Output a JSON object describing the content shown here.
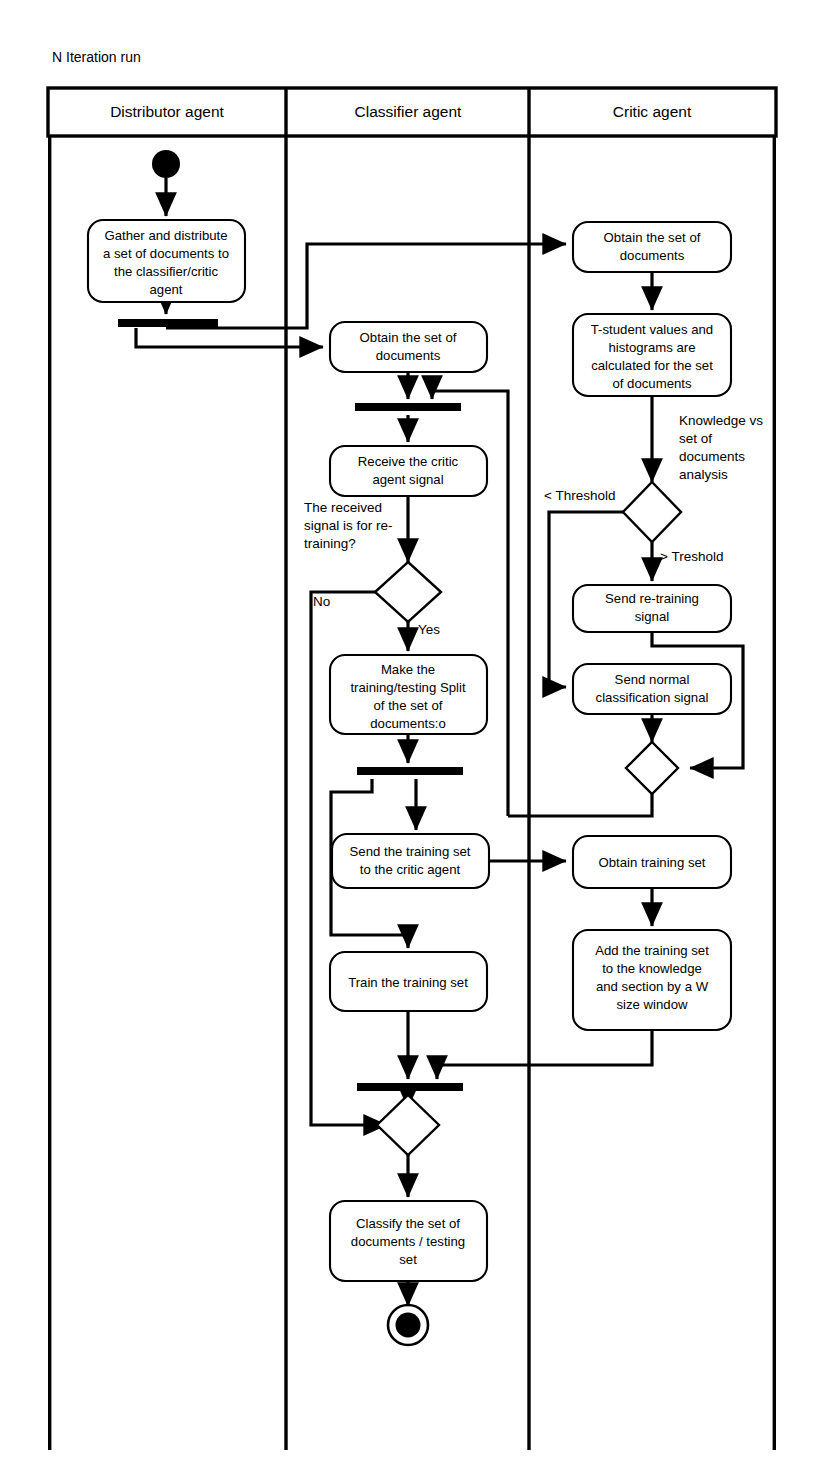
{
  "diagram": {
    "caption": "N Iteration run",
    "type": "uml-activity-diagram",
    "lanes": [
      {
        "id": "distributor",
        "label": "Distributor agent"
      },
      {
        "id": "classifier",
        "label": "Classifier agent"
      },
      {
        "id": "critic",
        "label": "Critic agent"
      }
    ],
    "nodes": {
      "start": {
        "kind": "initial-node",
        "lane": "distributor"
      },
      "gather": {
        "kind": "action",
        "lane": "distributor",
        "text": "Gather and distribute a set of documents to the classifier/critic agent",
        "lines": [
          "Gather and distribute",
          "a set of documents to",
          "the classifier/critic",
          "agent"
        ]
      },
      "fork_dist": {
        "kind": "fork-bar",
        "lane": "distributor"
      },
      "obtain_docs_cls": {
        "kind": "action",
        "lane": "classifier",
        "text": "Obtain the set of documents",
        "lines": [
          "Obtain the set of",
          "documents"
        ]
      },
      "join_cls_1": {
        "kind": "join-bar",
        "lane": "classifier"
      },
      "receive_signal": {
        "kind": "action",
        "lane": "classifier",
        "text": "Receive the critic agent signal",
        "lines": [
          "Receive the critic",
          "agent signal"
        ]
      },
      "decision_retrain": {
        "kind": "decision",
        "lane": "classifier"
      },
      "make_split": {
        "kind": "action",
        "lane": "classifier",
        "text": "Make the training/testing Split of the set of documents:o",
        "lines": [
          "Make the",
          "training/testing Split",
          "of the set of",
          "documents:o"
        ]
      },
      "fork_cls": {
        "kind": "fork-bar",
        "lane": "classifier"
      },
      "send_training_set": {
        "kind": "action",
        "lane": "classifier",
        "text": "Send the training set to the critic agent",
        "lines": [
          "Send the training set",
          "to the critic agent"
        ]
      },
      "train_set": {
        "kind": "action",
        "lane": "classifier",
        "text": "Train the training set",
        "lines": [
          "Train the training set"
        ]
      },
      "join_cls_2": {
        "kind": "join-bar",
        "lane": "classifier"
      },
      "merge_cls": {
        "kind": "merge",
        "lane": "classifier"
      },
      "classify": {
        "kind": "action",
        "lane": "classifier",
        "text": "Classify the set of documents / testing set",
        "lines": [
          "Classify the set of",
          "documents / testing",
          "set"
        ]
      },
      "end": {
        "kind": "final-node",
        "lane": "classifier"
      },
      "obtain_docs_critic": {
        "kind": "action",
        "lane": "critic",
        "text": "Obtain the set of documents",
        "lines": [
          "Obtain the set of",
          "documents"
        ]
      },
      "tstudent": {
        "kind": "action",
        "lane": "critic",
        "text": "T-student values and histograms are calculated for the set of documents",
        "lines": [
          "T-student values and",
          "histograms are",
          "calculated for the set",
          "of documents"
        ]
      },
      "decision_threshold": {
        "kind": "decision",
        "lane": "critic"
      },
      "send_retraining": {
        "kind": "action",
        "lane": "critic",
        "text": "Send re-training signal",
        "lines": [
          "Send re-training",
          "signal"
        ]
      },
      "send_normal": {
        "kind": "action",
        "lane": "critic",
        "text": "Send normal classification signal",
        "lines": [
          "Send normal",
          "classification signal"
        ]
      },
      "merge_critic": {
        "kind": "merge",
        "lane": "critic"
      },
      "obtain_training_set": {
        "kind": "action",
        "lane": "critic",
        "text": "Obtain training set",
        "lines": [
          "Obtain training set"
        ]
      },
      "add_training_set": {
        "kind": "action",
        "lane": "critic",
        "text": "Add the training set to the knowledge and section by a W size window",
        "lines": [
          "Add the training set",
          "to the knowledge",
          "and section by a W",
          "size window"
        ]
      }
    },
    "edge_labels": {
      "no": "No",
      "yes": "Yes",
      "below_threshold": "< Threshold",
      "above_threshold": "> Treshold",
      "knowledge_analysis": "Knowledge vs set of documents analysis",
      "knowledge_analysis_lines": [
        "Knowledge vs",
        "set of",
        "documents",
        "analysis"
      ],
      "retrain_question": "The received signal is for re-training?",
      "retrain_question_lines": [
        "The received",
        "signal is for re-",
        "training?"
      ]
    },
    "colors": {
      "stroke": "#000000",
      "fill": "#ffffff",
      "solid": "#000000"
    }
  }
}
